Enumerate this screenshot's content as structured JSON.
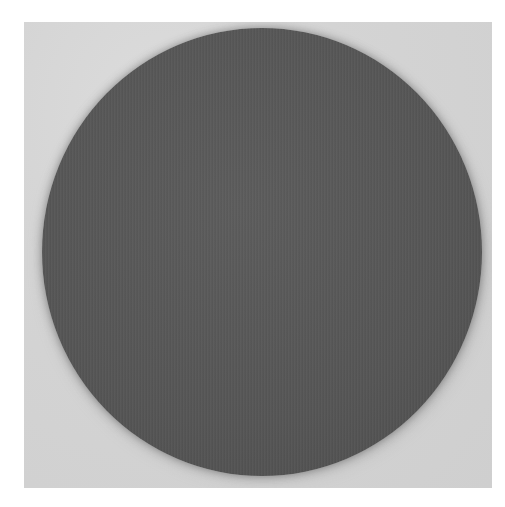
{
  "image": {
    "description": "Photograph of a dark gray felt-textured circular disc on a light gray background",
    "subject": "gray-disc",
    "colors": {
      "page_background": "#ffffff",
      "photo_background": "#d4d4d4",
      "disc": "#555555"
    }
  }
}
